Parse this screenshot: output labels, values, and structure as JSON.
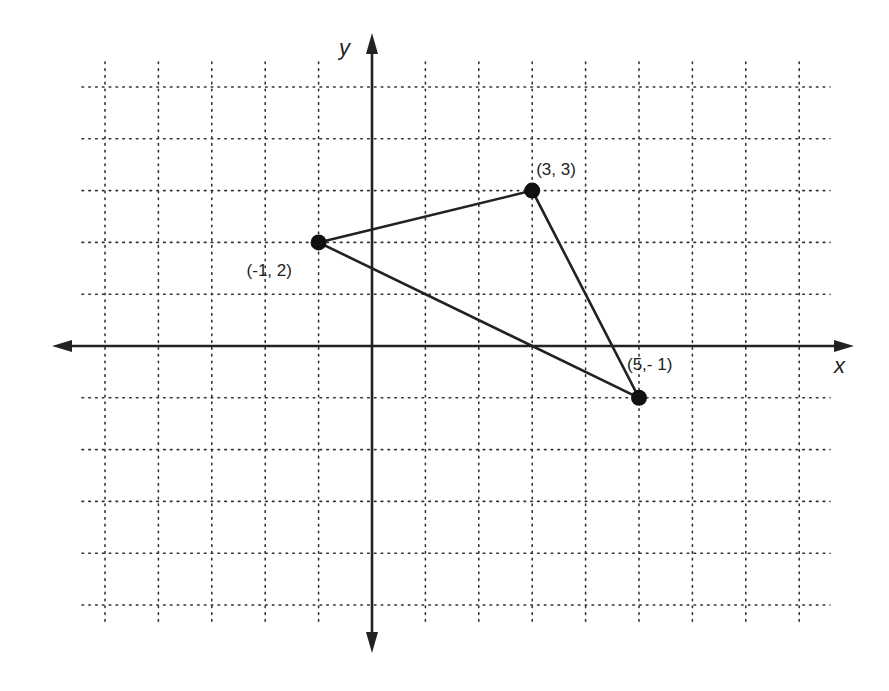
{
  "chart_data": {
    "type": "scatter",
    "title": "",
    "xlabel": "x",
    "ylabel": "y",
    "xlim": [
      -5,
      8
    ],
    "ylim": [
      -5,
      5
    ],
    "grid": true,
    "grid_style": "dotted",
    "legend": "none",
    "points": [
      {
        "x": -1,
        "y": 2,
        "label": "(-1, 2)"
      },
      {
        "x": 3,
        "y": 3,
        "label": "(3, 3)"
      },
      {
        "x": 5,
        "y": -1,
        "label": "(5,- 1)"
      }
    ],
    "shapes": [
      {
        "type": "polygon",
        "name": "triangle",
        "vertices": [
          [
            -1,
            2
          ],
          [
            3,
            3
          ],
          [
            5,
            -1
          ]
        ]
      }
    ],
    "colors": {
      "ink": "#222222",
      "background": "#ffffff"
    }
  },
  "labels": {
    "x_axis": "x",
    "y_axis": "y",
    "point_a": "(-1, 2)",
    "point_b": "(3, 3)",
    "point_c": "(5,- 1)"
  }
}
